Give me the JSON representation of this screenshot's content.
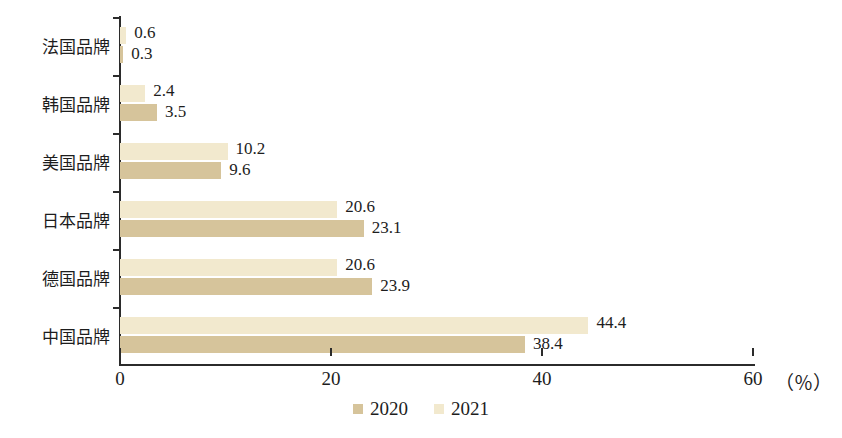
{
  "chart_data": {
    "type": "bar",
    "orientation": "horizontal",
    "title": "",
    "xlabel": "(%)",
    "ylabel": "",
    "xlim": [
      0,
      60
    ],
    "xticks": [
      0,
      20,
      40,
      60
    ],
    "grid": false,
    "legend_position": "bottom-center",
    "categories": [
      "法国品牌",
      "韩国品牌",
      "美国品牌",
      "日本品牌",
      "德国品牌",
      "中国品牌"
    ],
    "series": [
      {
        "name": "2021",
        "color": "#f2e9ce",
        "values": [
          0.6,
          2.4,
          10.2,
          20.6,
          20.6,
          44.4
        ]
      },
      {
        "name": "2020",
        "color": "#d6c49b",
        "values": [
          0.3,
          3.5,
          9.6,
          23.1,
          23.9,
          38.4
        ]
      }
    ],
    "data_labels": {
      "法国品牌": {
        "2021": "0.6",
        "2020": "0.3"
      },
      "韩国品牌": {
        "2021": "2.4",
        "2020": "3.5"
      },
      "美国品牌": {
        "2021": "10.2",
        "2020": "9.6"
      },
      "日本品牌": {
        "2021": "20.6",
        "2020": "23.1"
      },
      "德国品牌": {
        "2021": "20.6",
        "2020": "23.9"
      },
      "中国品牌": {
        "2021": "44.4",
        "2020": "38.4"
      }
    }
  },
  "axis": {
    "x_tick_labels": [
      "0",
      "20",
      "40",
      "60"
    ],
    "unit_label": "（％）"
  },
  "legend": {
    "items": [
      {
        "label": "2020",
        "color": "#d6c49b"
      },
      {
        "label": "2021",
        "color": "#f2e9ce"
      }
    ]
  }
}
